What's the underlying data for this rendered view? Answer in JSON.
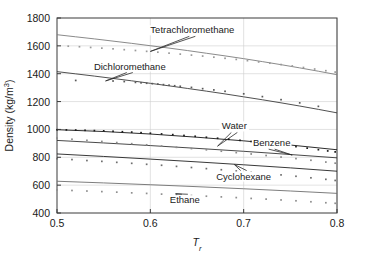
{
  "chart_data": {
    "type": "line",
    "title": "",
    "xlabel": "Tr",
    "xlabel_base": "T",
    "xlabel_sub": "r",
    "ylabel": "Density (kg/m",
    "ylabel_sup": "3",
    "ylabel_tail": ")",
    "ylabel_full": "Density (kg/m3)",
    "xlim": [
      0.5,
      0.8
    ],
    "ylim": [
      400,
      1800
    ],
    "xticks": [
      0.5,
      0.6,
      0.7,
      0.8
    ],
    "xtick_labels": [
      "0.5",
      "0.6",
      "0.7",
      "0.8"
    ],
    "yticks": [
      400,
      600,
      800,
      1000,
      1200,
      1400,
      1600,
      1800
    ],
    "ytick_labels": [
      "400",
      "600",
      "800",
      "1000",
      "1200",
      "1400",
      "1600",
      "1800"
    ],
    "grid": true,
    "grid_axis": "both",
    "legend": "inline-annotations",
    "series": [
      {
        "name": "Tetrachloromethane",
        "label": "Tetrachloromethane",
        "color": "#8c8c8c",
        "line_color": "#7d7d7d",
        "marker_color": "#9a9a9a",
        "x": [
          0.5,
          0.52,
          0.54,
          0.56,
          0.58,
          0.6,
          0.62,
          0.64,
          0.66,
          0.68,
          0.7,
          0.72,
          0.74,
          0.76,
          0.78,
          0.8
        ],
        "values": [
          1680,
          1665,
          1650,
          1634,
          1618,
          1601,
          1584,
          1566,
          1547,
          1528,
          1508,
          1487,
          1465,
          1442,
          1418,
          1393
        ],
        "points_x": [
          0.5,
          0.512,
          0.524,
          0.536,
          0.548,
          0.56,
          0.572,
          0.584,
          0.596,
          0.608,
          0.62,
          0.632,
          0.644,
          0.656,
          0.668,
          0.68,
          0.692,
          0.704,
          0.716,
          0.728,
          0.74,
          0.752,
          0.764,
          0.776,
          0.788,
          0.798
        ],
        "points_y": [
          1603,
          1598,
          1594,
          1589,
          1584,
          1579,
          1573,
          1567,
          1561,
          1555,
          1548,
          1541,
          1534,
          1527,
          1519,
          1511,
          1503,
          1494,
          1485,
          1476,
          1466,
          1456,
          1445,
          1434,
          1422,
          1412
        ],
        "annotation_x": 0.645,
        "annotation_y": 1690,
        "leader_to_x": 0.6,
        "leader_to_y": 1560
      },
      {
        "name": "Dichloromethane",
        "label": "Dichloromethane",
        "color": "#4a4a4a",
        "line_color": "#3c3c3c",
        "marker_color": "#5a5a5a",
        "x": [
          0.5,
          0.52,
          0.54,
          0.56,
          0.58,
          0.6,
          0.62,
          0.64,
          0.66,
          0.68,
          0.7,
          0.72,
          0.74,
          0.76,
          0.78,
          0.8
        ],
        "values": [
          1415,
          1399,
          1383,
          1366,
          1349,
          1331,
          1313,
          1294,
          1275,
          1255,
          1234,
          1213,
          1191,
          1168,
          1144,
          1119
        ],
        "points_x": [
          0.52,
          0.56,
          0.572,
          0.584,
          0.59,
          0.596,
          0.602,
          0.608,
          0.614,
          0.62,
          0.626,
          0.632,
          0.644,
          0.656,
          0.668,
          0.68,
          0.7,
          0.72,
          0.74,
          0.76,
          0.78
        ],
        "points_y": [
          1352,
          1348,
          1344,
          1338,
          1335,
          1332,
          1329,
          1326,
          1322,
          1318,
          1314,
          1310,
          1302,
          1293,
          1284,
          1274,
          1256,
          1236,
          1214,
          1191,
          1166
        ],
        "annotation_x": 0.578,
        "annotation_y": 1430,
        "leader_to_x": 0.552,
        "leader_to_y": 1348
      },
      {
        "name": "Water",
        "label": "Water",
        "color": "#1a1a1a",
        "line_color": "#141414",
        "marker_color": "#1a1a1a",
        "x": [
          0.5,
          0.55,
          0.6,
          0.65,
          0.7,
          0.75,
          0.8
        ],
        "values": [
          998,
          985,
          967,
          944,
          918,
          888,
          854
        ],
        "points_x": [
          0.5,
          0.51,
          0.52,
          0.53,
          0.54,
          0.55,
          0.56,
          0.57,
          0.58,
          0.59,
          0.6,
          0.612,
          0.624,
          0.636,
          0.648,
          0.66,
          0.672,
          0.684,
          0.696,
          0.708,
          0.72,
          0.732,
          0.744,
          0.756,
          0.768,
          0.78,
          0.79,
          0.798
        ],
        "points_y": [
          998,
          997,
          996,
          994,
          992,
          990,
          987,
          984,
          981,
          977,
          973,
          968,
          963,
          957,
          951,
          944,
          937,
          930,
          922,
          914,
          905,
          896,
          887,
          877,
          866,
          855,
          846,
          839
        ],
        "annotation_x": 0.69,
        "annotation_y": 1000,
        "leader_to_x": 0.672,
        "leader_to_y": 880
      },
      {
        "name": "Benzene",
        "label": "Benzene",
        "color": "#3c3c3c",
        "line_color": "#343434",
        "marker_color": "#8a8a8a",
        "x": [
          0.5,
          0.55,
          0.6,
          0.65,
          0.7,
          0.75,
          0.8
        ],
        "values": [
          921,
          903,
          884,
          864,
          843,
          820,
          796
        ],
        "points_x": [
          0.5,
          0.516,
          0.532,
          0.548,
          0.564,
          0.58,
          0.596,
          0.612,
          0.628,
          0.644,
          0.66,
          0.676,
          0.692,
          0.708,
          0.724,
          0.74,
          0.756,
          0.772,
          0.788,
          0.798
        ],
        "points_y": [
          938,
          930,
          922,
          914,
          906,
          898,
          890,
          881,
          872,
          863,
          854,
          844,
          834,
          824,
          813,
          802,
          791,
          779,
          766,
          758
        ],
        "annotation_x": 0.73,
        "annotation_y": 880,
        "leader_to_x": 0.752,
        "leader_to_y": 816
      },
      {
        "name": "Cyclohexane",
        "label": "Cyclohexane",
        "color": "#2a2a2a",
        "line_color": "#222222",
        "marker_color": "#6f6f6f",
        "x": [
          0.5,
          0.55,
          0.6,
          0.65,
          0.7,
          0.75,
          0.8
        ],
        "values": [
          824,
          806,
          787,
          767,
          746,
          724,
          700
        ],
        "points_x": [
          0.5,
          0.516,
          0.532,
          0.548,
          0.564,
          0.58,
          0.596,
          0.612,
          0.628,
          0.644,
          0.66,
          0.676,
          0.692,
          0.708,
          0.724,
          0.74,
          0.756,
          0.772,
          0.788,
          0.798
        ],
        "points_y": [
          790,
          784,
          777,
          771,
          764,
          757,
          750,
          743,
          735,
          727,
          719,
          711,
          702,
          693,
          684,
          674,
          664,
          653,
          642,
          634
        ],
        "annotation_x": 0.7,
        "annotation_y": 640,
        "leader_to_x": 0.69,
        "leader_to_y": 748
      },
      {
        "name": "Ethane",
        "label": "Ethane",
        "color": "#7a7a7a",
        "line_color": "#6e6e6e",
        "marker_color": "#8f8f8f",
        "x": [
          0.5,
          0.55,
          0.6,
          0.65,
          0.7,
          0.75,
          0.8
        ],
        "values": [
          628,
          616,
          603,
          589,
          574,
          558,
          541
        ],
        "points_x": [
          0.5,
          0.516,
          0.532,
          0.548,
          0.564,
          0.58,
          0.596,
          0.612,
          0.628,
          0.644,
          0.66,
          0.676,
          0.692,
          0.708,
          0.724,
          0.74,
          0.756,
          0.772,
          0.788,
          0.798
        ],
        "points_y": [
          566,
          562,
          558,
          554,
          550,
          545,
          541,
          536,
          531,
          526,
          521,
          516,
          511,
          505,
          500,
          494,
          488,
          481,
          474,
          470
        ],
        "annotation_x": 0.637,
        "annotation_y": 470,
        "leader_to_x": 0.627,
        "leader_to_y": 538
      }
    ]
  },
  "figure": {
    "background": "#ffffff",
    "axis_color": "#3a3a3a",
    "grid_color": "#cfcfcf",
    "text_color": "#1a1a1a"
  }
}
